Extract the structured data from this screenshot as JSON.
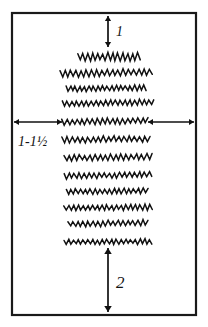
{
  "figure": {
    "background_color": "#ffffff",
    "ink_color": "#111111",
    "frame": {
      "name": "fabric-panel-border",
      "x": 12,
      "y": 13,
      "width": 184,
      "height": 302,
      "stroke_color": "#1a1a1a"
    },
    "annotations": {
      "top": {
        "label": "1",
        "description": "top margin dimension",
        "arrow": "vertical-double-arrow",
        "x": 108,
        "y_start": 16,
        "y_end": 47,
        "text_x": 116,
        "text_y": 36
      },
      "left": {
        "label": "1-1½",
        "description": "side margin dimension",
        "arrow": "horizontal-double-arrow",
        "y": 122,
        "x_start": 14,
        "x_end": 62,
        "text_x": 18,
        "text_y": 146
      },
      "right": {
        "label": "",
        "description": "right side margin dimension",
        "arrow": "horizontal-double-arrow",
        "y": 122,
        "x_start": 148,
        "x_end": 194
      },
      "bottom": {
        "label": "2",
        "description": "bottom margin dimension",
        "arrow": "vertical-double-arrow",
        "x": 108,
        "y_start": 248,
        "y_end": 312,
        "text_x": 116,
        "text_y": 288
      }
    },
    "stitch_rows": [
      {
        "id": 1,
        "y": 57,
        "x_start": 78,
        "x_end": 140,
        "amplitude": 7.5,
        "period": 5.0,
        "tilt": 0.0
      },
      {
        "id": 2,
        "y": 74,
        "x_start": 60,
        "x_end": 152,
        "amplitude": 6.0,
        "period": 5.2,
        "tilt": -2.0
      },
      {
        "id": 3,
        "y": 89,
        "x_start": 66,
        "x_end": 146,
        "amplitude": 5.0,
        "period": 4.6,
        "tilt": -1.5
      },
      {
        "id": 4,
        "y": 104,
        "x_start": 62,
        "x_end": 154,
        "amplitude": 5.0,
        "period": 4.8,
        "tilt": -2.0
      },
      {
        "id": 5,
        "y": 122,
        "x_start": 62,
        "x_end": 148,
        "amplitude": 5.5,
        "period": 5.0,
        "tilt": -1.5
      },
      {
        "id": 6,
        "y": 140,
        "x_start": 62,
        "x_end": 150,
        "amplitude": 5.5,
        "period": 5.2,
        "tilt": -1.5
      },
      {
        "id": 7,
        "y": 158,
        "x_start": 64,
        "x_end": 152,
        "amplitude": 5.5,
        "period": 5.2,
        "tilt": -1.5
      },
      {
        "id": 8,
        "y": 176,
        "x_start": 64,
        "x_end": 152,
        "amplitude": 5.0,
        "period": 5.0,
        "tilt": -1.5
      },
      {
        "id": 9,
        "y": 192,
        "x_start": 66,
        "x_end": 148,
        "amplitude": 5.0,
        "period": 4.8,
        "tilt": -1.5
      },
      {
        "id": 10,
        "y": 208,
        "x_start": 64,
        "x_end": 152,
        "amplitude": 5.0,
        "period": 4.8,
        "tilt": -1.0
      },
      {
        "id": 11,
        "y": 224,
        "x_start": 68,
        "x_end": 148,
        "amplitude": 5.0,
        "period": 5.0,
        "tilt": -1.5
      },
      {
        "id": 12,
        "y": 242,
        "x_start": 64,
        "x_end": 152,
        "amplitude": 4.5,
        "period": 4.8,
        "tilt": -0.5
      }
    ]
  }
}
